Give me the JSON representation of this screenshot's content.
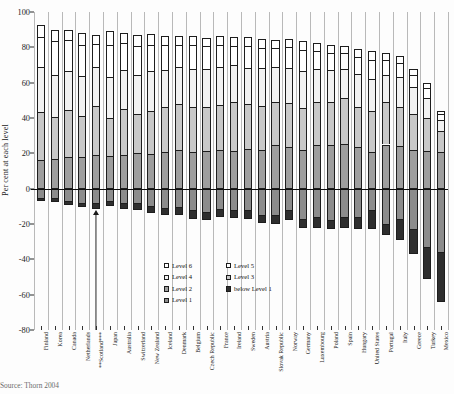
{
  "chart_data": {
    "type": "bar",
    "subtype": "stacked-diverging-horizontalcategories",
    "title": "",
    "xlabel": "",
    "ylabel": "Per cent at each level",
    "ylim": [
      -80,
      100
    ],
    "yticks": [
      100,
      80,
      60,
      40,
      20,
      0,
      -20,
      -40,
      -60,
      -80
    ],
    "ytick_labels": [
      "100",
      "80",
      "60",
      "40",
      "20",
      "0",
      "-20",
      "-40",
      "-60",
      "-80"
    ],
    "grid": false,
    "vertical_separators": true,
    "zero_line": true,
    "legend_position": "inside-lower-center",
    "legend_columns": 2,
    "categories": [
      "Finland",
      "Korea",
      "Canada",
      "Netherlands",
      "**Scotland***",
      "Japan",
      "Australia",
      "Switzerland",
      "New Zealand",
      "Iceland",
      "Denmark",
      "Belgium",
      "Czech Republic",
      "France",
      "Ireland",
      "Sweden",
      "Austria",
      "Slovak Republic",
      "Norway",
      "Germany",
      "Luxembourg",
      "Poland",
      "Spain",
      "Hungary",
      "United States",
      "Portugal",
      "Italy",
      "Greece",
      "Turkey",
      "Mexico"
    ],
    "series": [
      {
        "name": "below Level 1",
        "color": "#2e2e2e",
        "direction": "negative",
        "values": [
          1.5,
          2.0,
          2.3,
          2.4,
          3.5,
          2.8,
          3.5,
          4.0,
          4.0,
          4.0,
          4.3,
          5.0,
          4.5,
          4.5,
          4.5,
          5.0,
          4.5,
          5.0,
          5.5,
          5.0,
          6.0,
          5.5,
          6.0,
          7.0,
          11.0,
          6.0,
          12.0,
          14.0,
          18.0,
          28.0
        ]
      },
      {
        "name": "Level 1",
        "color": "#8c8c8c",
        "direction": "negative",
        "values": [
          5.5,
          5.5,
          7.0,
          8.0,
          8.0,
          7.2,
          8.0,
          8.0,
          10.0,
          11.0,
          10.5,
          12.0,
          13.0,
          11.5,
          12.0,
          12.0,
          15.0,
          15.0,
          12.0,
          17.0,
          16.0,
          17.5,
          16.0,
          16.0,
          12.0,
          20.0,
          17.0,
          23.0,
          33.0,
          36.0
        ]
      },
      {
        "name": "Level 2",
        "color": "#9e9e9e",
        "direction": "positive",
        "values": [
          16.0,
          17.0,
          18.0,
          18.0,
          19.0,
          18.5,
          19.0,
          20.0,
          19.5,
          20.5,
          22.0,
          21.0,
          21.5,
          22.0,
          21.5,
          22.5,
          22.0,
          24.5,
          23.5,
          22.0,
          24.5,
          24.5,
          25.5,
          23.5,
          21.0,
          25.0,
          24.0,
          22.0,
          21.5,
          20.5
        ]
      },
      {
        "name": "Level 3",
        "color": "#c8c8c8",
        "direction": "positive",
        "values": [
          27.5,
          23.5,
          26.5,
          23.0,
          28.0,
          21.5,
          26.0,
          22.0,
          24.5,
          25.5,
          26.0,
          25.0,
          24.5,
          25.5,
          27.5,
          25.5,
          25.0,
          24.5,
          25.0,
          23.5,
          24.5,
          24.5,
          26.0,
          23.0,
          23.0,
          24.0,
          22.0,
          20.0,
          18.5,
          12.0
        ]
      },
      {
        "name": "Level 4",
        "color": "#f2f2f2",
        "direction": "positive",
        "values": [
          25.5,
          24.0,
          22.0,
          22.5,
          22.0,
          23.0,
          22.0,
          22.5,
          22.5,
          21.0,
          21.0,
          22.0,
          21.5,
          21.5,
          21.0,
          20.5,
          21.5,
          20.0,
          20.0,
          21.0,
          19.0,
          18.0,
          16.5,
          18.5,
          18.0,
          15.5,
          17.0,
          15.5,
          11.5,
          6.5
        ]
      },
      {
        "name": "Level 5",
        "color": "#ffffff",
        "direction": "positive",
        "values": [
          17.0,
          19.0,
          17.5,
          18.0,
          13.0,
          18.5,
          15.5,
          16.0,
          15.0,
          14.5,
          12.5,
          13.5,
          13.0,
          12.5,
          11.0,
          12.5,
          11.0,
          10.5,
          11.5,
          12.0,
          10.0,
          10.0,
          9.0,
          9.5,
          11.0,
          8.5,
          8.0,
          7.0,
          5.5,
          3.0
        ]
      },
      {
        "name": "Level 6",
        "color": "#ffffff",
        "direction": "positive",
        "values": [
          6.5,
          6.5,
          6.0,
          6.5,
          5.0,
          7.5,
          5.5,
          6.5,
          6.0,
          5.0,
          5.0,
          5.0,
          5.0,
          5.0,
          5.0,
          5.0,
          5.0,
          4.5,
          5.0,
          5.0,
          4.5,
          4.5,
          4.0,
          4.5,
          5.0,
          4.0,
          4.0,
          3.5,
          3.0,
          2.0
        ]
      }
    ],
    "annotation": {
      "type": "arrow",
      "points_to_category": "**Scotland***",
      "category_index": 4
    }
  },
  "legend": {
    "column1": [
      {
        "label": "Level 6",
        "swatch": "#ffffff"
      },
      {
        "label": "Level 4",
        "swatch": "#f2f2f2"
      },
      {
        "label": "Level 2",
        "swatch": "#9e9e9e"
      },
      {
        "label": "Level 1",
        "swatch": "#8c8c8c"
      }
    ],
    "column2": [
      {
        "label": "Level 5",
        "swatch": "#ffffff"
      },
      {
        "label": "Level 3",
        "swatch": "#c8c8c8"
      },
      {
        "label": "below Level 1",
        "swatch": "#2e2e2e"
      }
    ]
  },
  "source_note": "Source: Thorn 2004"
}
